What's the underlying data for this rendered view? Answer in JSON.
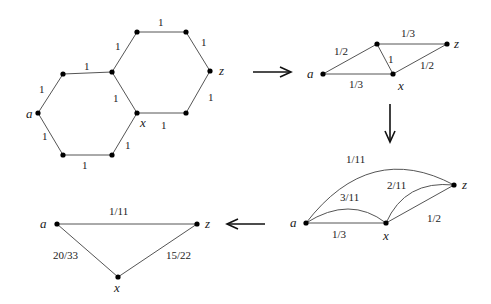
{
  "graphs": [
    {
      "id": "hexagon-network",
      "vertex_labels": {
        "a": "a",
        "x": "x",
        "z": "z"
      },
      "edge_labels": [
        "1",
        "1",
        "1",
        "1",
        "1",
        "1",
        "1",
        "1",
        "1",
        "1",
        "1"
      ]
    },
    {
      "id": "reduced-network-1",
      "vertex_labels": {
        "a": "a",
        "x": "x",
        "z": "z"
      },
      "edge_labels": {
        "a_top": "1/2",
        "top_z": "1/3",
        "top_x": "1",
        "a_x": "1/3",
        "x_z": "1/2"
      }
    },
    {
      "id": "reduced-network-2",
      "vertex_labels": {
        "a": "a",
        "x": "x",
        "z": "z"
      },
      "edge_labels": {
        "a_z": "1/11",
        "a_x_arc": "3/11",
        "x_z_arc": "2/11",
        "x_z": "1/2",
        "a_x": "1/3"
      }
    },
    {
      "id": "triangle-network",
      "vertex_labels": {
        "a": "a",
        "x": "x",
        "z": "z"
      },
      "edge_labels": {
        "a_z": "1/11",
        "a_x": "20/33",
        "x_z": "15/22"
      }
    }
  ],
  "arrows": [
    "right-arrow",
    "down-arrow",
    "left-arrow"
  ]
}
